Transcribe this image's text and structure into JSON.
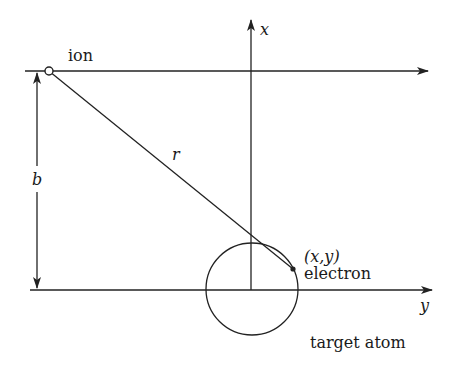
{
  "diagram": {
    "type": "physics-schematic",
    "labels": {
      "ion": "ion",
      "x_axis": "x",
      "y_axis": "y",
      "distance": "r",
      "impact_parameter": "b",
      "electron_coords": "(x,y)",
      "electron": "electron",
      "target_atom": "target atom"
    },
    "elements": {
      "ion_path": {
        "from": [
          25,
          71
        ],
        "to": [
          428,
          71
        ],
        "arrow": "end"
      },
      "y_axis_line": {
        "from": [
          30,
          290
        ],
        "to": [
          432,
          290
        ],
        "arrow": "end"
      },
      "x_axis_line": {
        "from": [
          251,
          290
        ],
        "to": [
          251,
          20
        ],
        "arrow": "end"
      },
      "ion_marker": {
        "cx": 49,
        "cy": 71,
        "r": 4,
        "fill": "open"
      },
      "r_line": {
        "from": [
          49,
          71
        ],
        "to": [
          293,
          269
        ]
      },
      "b_dimension": {
        "x": 37,
        "from_y": 71,
        "to_y": 290,
        "arrows": "both"
      },
      "atom_circle": {
        "cx": 252,
        "cy": 289,
        "r": 46
      },
      "electron_marker": {
        "cx": 293,
        "cy": 269,
        "r": 2.5,
        "fill": "solid"
      }
    },
    "colors": {
      "line": "#222222",
      "background": "#ffffff",
      "text": "#1a1a1a"
    }
  }
}
